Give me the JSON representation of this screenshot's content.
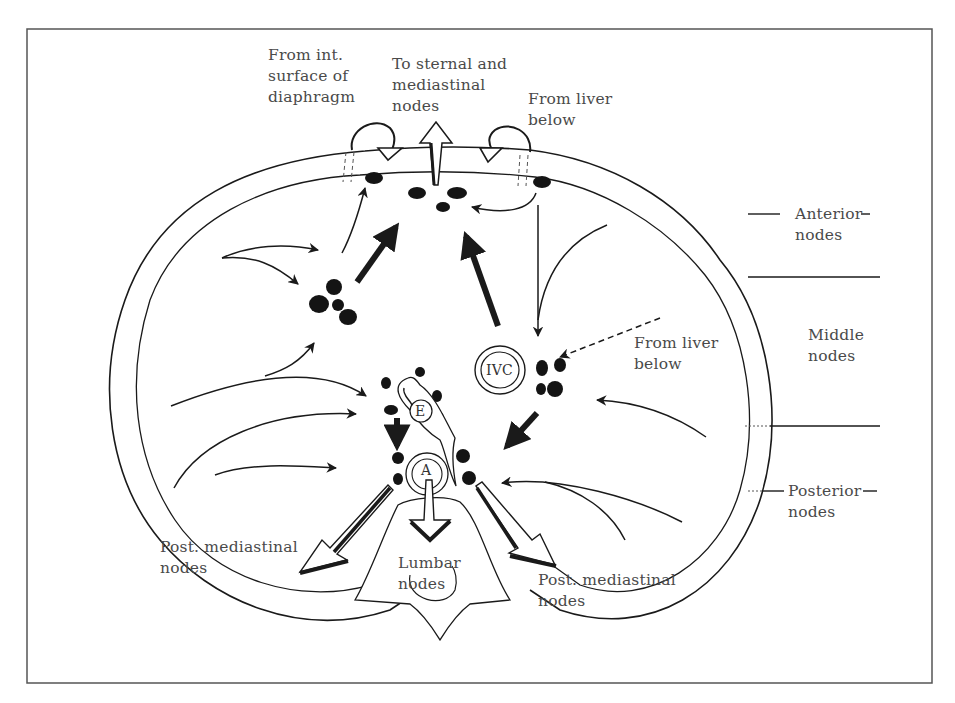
{
  "diagram": {
    "type": "anatomical cross-section of diaphragm lymphatic drainage",
    "top_labels": {
      "left": "From int.\nsurface of\ndiaphragm",
      "center": "To sternal and\nmediastinal\nnodes",
      "right": "From liver\nbelow"
    },
    "side_labels": {
      "anterior": "Anterior\nnodes",
      "middle": "Middle\nnodes",
      "posterior": "Posterior\nnodes"
    },
    "inner_labels": {
      "liver_right": "From liver\nbelow",
      "post_left": "Post. mediastinal\nnodes",
      "lumbar": "Lumbar\nnodes",
      "post_right": "Post. mediastinal\nnodes"
    },
    "structures": {
      "ivc": "IVC",
      "esophagus": "E",
      "aorta": "A"
    },
    "colors": {
      "line": "#1a1a1a",
      "node": "#141414",
      "frame": "#555555",
      "text": "#4a4a4a"
    }
  }
}
